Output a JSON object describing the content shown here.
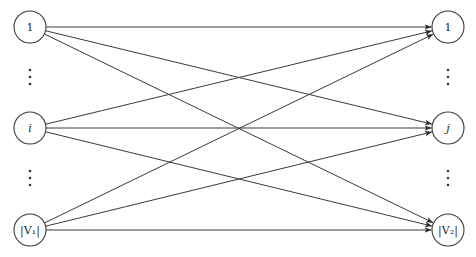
{
  "diagram": {
    "title": "",
    "style": {
      "stroke_color": "#3a3a3a",
      "background": "#ffffff",
      "node_radius": 16
    },
    "left_layer": {
      "x": 30,
      "nodes": [
        {
          "id": "L1",
          "label": "1",
          "italic": false,
          "y": 27
        },
        {
          "id": "Li",
          "label": "i",
          "italic": true,
          "y": 128
        },
        {
          "id": "Ln",
          "label": "|V₁|",
          "italic": false,
          "y": 230
        }
      ],
      "ellipsis_dots": [
        {
          "y": [
            70,
            77,
            84
          ]
        },
        {
          "y": [
            171,
            178,
            185
          ]
        }
      ]
    },
    "right_layer": {
      "x": 448,
      "nodes": [
        {
          "id": "R1",
          "label": "1",
          "italic": false,
          "y": 27
        },
        {
          "id": "Rj",
          "label": "j",
          "italic": true,
          "y": 128
        },
        {
          "id": "Rn",
          "label": "|V₂|",
          "italic": false,
          "y": 230
        }
      ],
      "ellipsis_dots": [
        {
          "y": [
            70,
            77,
            84
          ]
        },
        {
          "y": [
            171,
            178,
            185
          ]
        }
      ]
    },
    "edges": [
      {
        "from": "L1",
        "to": "R1"
      },
      {
        "from": "L1",
        "to": "Rj"
      },
      {
        "from": "L1",
        "to": "Rn"
      },
      {
        "from": "Li",
        "to": "R1"
      },
      {
        "from": "Li",
        "to": "Rj"
      },
      {
        "from": "Li",
        "to": "Rn"
      },
      {
        "from": "Ln",
        "to": "R1"
      },
      {
        "from": "Ln",
        "to": "Rj"
      },
      {
        "from": "Ln",
        "to": "Rn"
      }
    ],
    "directed": true
  }
}
